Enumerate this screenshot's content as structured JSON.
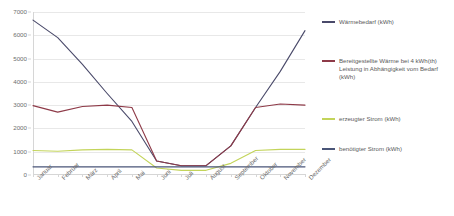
{
  "chart_data": {
    "type": "line",
    "title": "",
    "xlabel": "",
    "ylabel": "",
    "ylim": [
      0,
      7000
    ],
    "ytick_step": 1000,
    "yticks": [
      0,
      1000,
      2000,
      3000,
      4000,
      5000,
      6000,
      7000
    ],
    "ytick_labels": [
      "0",
      "1000",
      "2000",
      "3000",
      "4000",
      "5000",
      "6000",
      "7000"
    ],
    "grid": true,
    "legend_position": "right",
    "categories": [
      "Januar",
      "Februar",
      "März",
      "April",
      "Mai",
      "Juni",
      "Juli",
      "August",
      "September",
      "Oktober",
      "November",
      "Dezember"
    ],
    "series": [
      {
        "name": "Wärmebedarf (kWh)",
        "color": "#4a4a6a",
        "values": [
          6650,
          5900,
          4750,
          3500,
          2300,
          600,
          400,
          400,
          1250,
          2900,
          4450,
          6200
        ]
      },
      {
        "name": "Bereitgestellte Wärme bei 4 kWh(th) Leistung in Abhängigkeit vom Bedarf (kWh)",
        "color": "#8e3a48",
        "values": [
          2980,
          2700,
          2940,
          3000,
          2900,
          600,
          400,
          400,
          1250,
          2900,
          3050,
          3000
        ]
      },
      {
        "name": "erzeugter Strom (kWh)",
        "color": "#c3d45a",
        "values": [
          1050,
          1020,
          1080,
          1100,
          1080,
          300,
          200,
          200,
          500,
          1050,
          1100,
          1100
        ]
      },
      {
        "name": "benötigter Strom (kWh)",
        "color": "#4a5578",
        "values": [
          350,
          350,
          350,
          350,
          350,
          350,
          350,
          350,
          350,
          350,
          350,
          350
        ]
      }
    ]
  },
  "legend": {
    "items": [
      {
        "label": "Wärmebedarf (kWh)",
        "color": "#4a4a6a"
      },
      {
        "label": "Bereitgestellte Wärme bei 4 kWh(th) Leistung in Abhängigkeit vom Bedarf (kWh)",
        "color": "#8e3a48"
      },
      {
        "label": "erzeugter Strom (kWh)",
        "color": "#c3d45a"
      },
      {
        "label": "benötigter Strom (kWh)",
        "color": "#4a5578"
      }
    ]
  }
}
